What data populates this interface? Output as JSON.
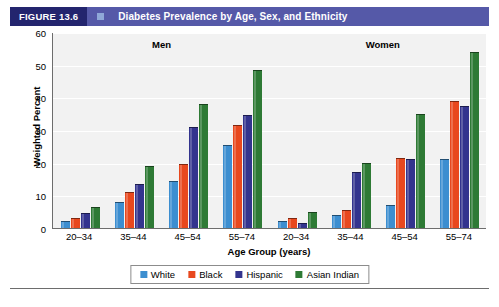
{
  "header": {
    "figure_tag": "FIGURE 13.6",
    "marker": "square-marker",
    "title": "Diabetes Prevalence by Age, Sex, and Ethnicity",
    "tag_color": "#23256e",
    "band_color": "#5559a8"
  },
  "panels": [
    {
      "label": "Men"
    },
    {
      "label": "Women"
    }
  ],
  "legend": {
    "items": [
      {
        "label": "White",
        "color": "#3c8ed0"
      },
      {
        "label": "Black",
        "color": "#e8481e"
      },
      {
        "label": "Hispanic",
        "color": "#33348e"
      },
      {
        "label": "Asian Indian",
        "color": "#2e7a35"
      }
    ]
  },
  "chart_data": {
    "type": "bar",
    "title": "Diabetes Prevalence by Age, Sex, and Ethnicity",
    "xlabel": "Age Group (years)",
    "ylabel": "Weighted Percent",
    "ylim": [
      0,
      60
    ],
    "yticks": [
      0,
      10,
      20,
      30,
      40,
      50,
      60
    ],
    "grid": true,
    "legend_position": "bottom",
    "panels": [
      "Men",
      "Women"
    ],
    "categories": [
      "20–34",
      "35–44",
      "45–54",
      "55–74"
    ],
    "categories_full": [
      "20–34",
      "35–44",
      "45–54",
      "55–74",
      "20–34",
      "35–44",
      "45–54",
      "55–74"
    ],
    "series": [
      {
        "name": "White",
        "color": "#3c8ed0",
        "values_men": [
          2.0,
          8.0,
          14.5,
          25.5
        ],
        "values_women": [
          2.0,
          4.0,
          7.0,
          21.0
        ]
      },
      {
        "name": "Black",
        "color": "#e8481e",
        "values_men": [
          3.0,
          11.0,
          19.5,
          31.5
        ],
        "values_women": [
          3.0,
          5.5,
          21.5,
          39.0
        ]
      },
      {
        "name": "Hispanic",
        "color": "#33348e",
        "values_men": [
          4.5,
          13.5,
          31.0,
          34.5
        ],
        "values_women": [
          1.5,
          17.0,
          21.0,
          37.5
        ]
      },
      {
        "name": "Asian Indian",
        "color": "#2e7a35",
        "values_men": [
          6.5,
          19.0,
          38.0,
          48.5
        ],
        "values_women": [
          5.0,
          20.0,
          35.0,
          54.0
        ]
      }
    ]
  }
}
